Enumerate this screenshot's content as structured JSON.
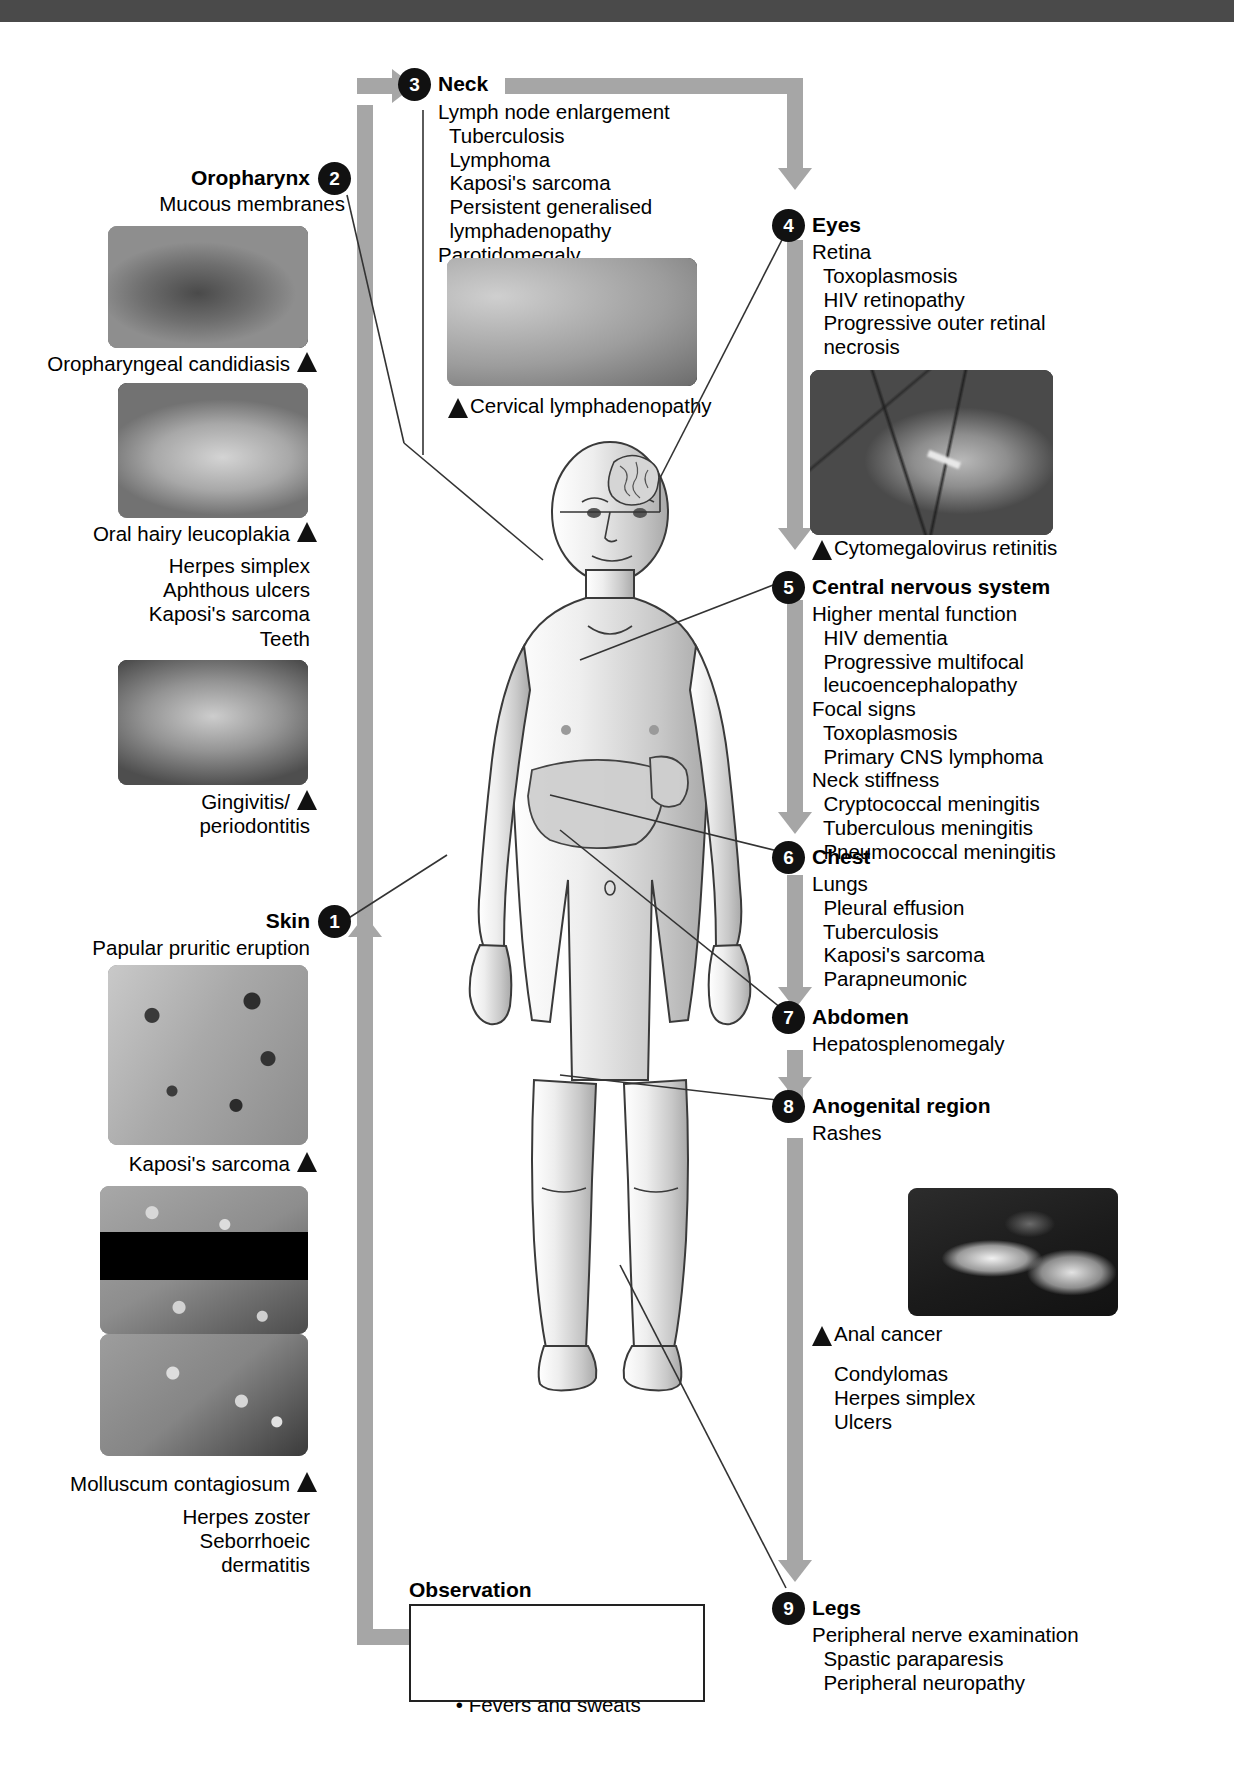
{
  "figure": {
    "type": "clinical-examination-flowchart"
  },
  "sections": {
    "skin": {
      "number": "1",
      "heading": "Skin",
      "lines": [
        "Papular pruritic eruption"
      ],
      "captions": [
        "Kaposi's sarcoma",
        "Molluscum contagiosum"
      ],
      "tail": [
        "Herpes zoster",
        "Seborrhoeic",
        "dermatitis"
      ]
    },
    "oropharynx": {
      "number": "2",
      "heading": "Oropharynx",
      "subhead": "Mucous membranes",
      "caption1": "Oropharyngeal candidiasis",
      "caption2": "Oral hairy leucoplakia",
      "list": [
        "Herpes simplex",
        "Aphthous ulcers",
        "Kaposi's sarcoma"
      ],
      "teeth": "Teeth",
      "caption3a": "Gingivitis/",
      "caption3b": "periodontitis"
    },
    "neck": {
      "number": "3",
      "heading": "Neck",
      "lines": [
        "Lymph node enlargement",
        "  Tuberculosis",
        "  Lymphoma",
        "  Kaposi's sarcoma",
        "  Persistent generalised",
        "  lymphadenopathy",
        "Parotidomegaly"
      ],
      "caption": "Cervical lymphadenopathy"
    },
    "eyes": {
      "number": "4",
      "heading": "Eyes",
      "lines": [
        "Retina",
        "  Toxoplasmosis",
        "  HIV retinopathy",
        "  Progressive outer retinal",
        "  necrosis"
      ],
      "caption": "Cytomegalovirus retinitis"
    },
    "cns": {
      "number": "5",
      "heading": "Central nervous system",
      "lines": [
        "Higher mental function",
        "  HIV dementia",
        "  Progressive multifocal",
        "  leucoencephalopathy",
        "Focal signs",
        "  Toxoplasmosis",
        "  Primary CNS lymphoma",
        "Neck stiffness",
        "  Cryptococcal meningitis",
        "  Tuberculous meningitis",
        "  Pneumococcal meningitis"
      ]
    },
    "chest": {
      "number": "6",
      "heading": "Chest",
      "lines": [
        "Lungs",
        "  Pleural effusion",
        "  Tuberculosis",
        "  Kaposi's sarcoma",
        "  Parapneumonic"
      ]
    },
    "abdomen": {
      "number": "7",
      "heading": "Abdomen",
      "lines": [
        "Hepatosplenomegaly"
      ]
    },
    "anogenital": {
      "number": "8",
      "heading": "Anogenital region",
      "lines": [
        "Rashes"
      ],
      "caption": "Anal cancer",
      "tail": [
        "Condylomas",
        "Herpes simplex",
        "Ulcers"
      ]
    },
    "legs": {
      "number": "9",
      "heading": "Legs",
      "lines": [
        "Peripheral nerve examination",
        "  Spastic paraparesis",
        "  Peripheral neuropathy"
      ]
    }
  },
  "observation": {
    "heading": "Observation",
    "items": [
      "Weight loss",
      "Tachypnoea",
      "Fevers and sweats"
    ]
  },
  "colors": {
    "flow_arrow": "#a6a6a6",
    "bullet_bg": "#111111",
    "bullet_text": "#ffffff",
    "topbar": "#4a4a4a",
    "text": "#000000"
  }
}
